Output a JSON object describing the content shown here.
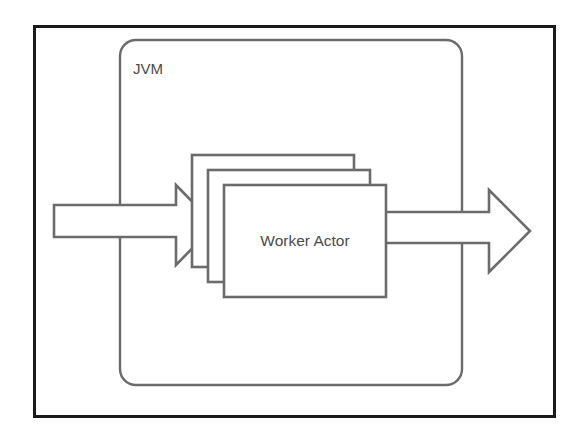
{
  "diagram": {
    "type": "architecture-block-diagram",
    "canvas": {
      "width": 587,
      "height": 438,
      "background": "#ffffff"
    },
    "outer_frame": {
      "label": "",
      "x": 33,
      "y": 25,
      "width": 522,
      "height": 392,
      "stroke": "#1a1a1a",
      "stroke_width": 3
    },
    "jvm_container": {
      "label": "JVM",
      "x": 120,
      "y": 40,
      "width": 342,
      "height": 345,
      "corner_radius": 16,
      "stroke": "#6b6b6b",
      "label_x": 133,
      "label_y": 74
    },
    "actor_stack": {
      "label": "Worker Actor",
      "count": 3,
      "offset_x": 16,
      "offset_y": 15,
      "box_width": 162,
      "box_height": 112,
      "front_x": 224,
      "front_y": 185,
      "stroke": "#6b6b6b",
      "fill": "#ffffff",
      "label_x": 305,
      "label_y": 246
    },
    "arrows": [
      {
        "name": "input-arrow",
        "direction": "right",
        "label": "",
        "shaft_start_x": 54,
        "shaft_top_y": 205,
        "shaft_bottom_y": 237,
        "head_start_x": 176,
        "head_top_y": 185,
        "head_bottom_y": 265,
        "tip_x": 215,
        "tip_y": 225
      },
      {
        "name": "output-arrow",
        "direction": "right",
        "label": "",
        "shaft_start_x": 385,
        "shaft_top_y": 212,
        "shaft_bottom_y": 243,
        "head_start_x": 489,
        "head_top_y": 190,
        "head_bottom_y": 272,
        "tip_x": 530,
        "tip_y": 231
      }
    ]
  }
}
